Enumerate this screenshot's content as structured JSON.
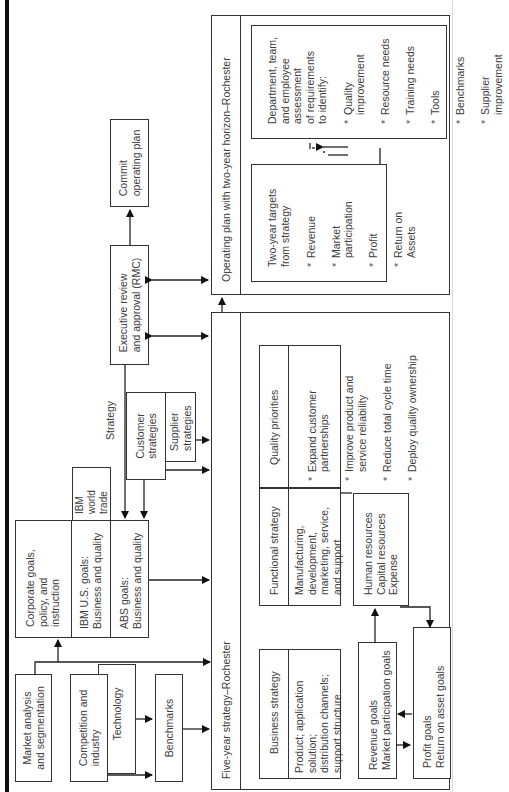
{
  "diagram": {
    "inputs": {
      "market_analysis": "Market analysis\nand segmentation",
      "competition": "Competition and\nindustry",
      "technology": "Technology",
      "benchmarks": "Benchmarks"
    },
    "goals": {
      "corporate": "Corporate goals,\npolicy, and\ninstruction",
      "ibm_us": "IBM U.S. goals:\nBusiness and quality",
      "abs": "ABS goals:\nBusiness and quality",
      "ibm_world_trade": "IBM\nworld\ntrade"
    },
    "strategy_label": "Strategy",
    "customer_strategies": "Customer\nstrategies",
    "supplier_strategies": "Supplier\nstrategies",
    "executive_review": "Executive review\nand approval (RMC)",
    "commit_plan": "Commit\noperating plan",
    "five_year": {
      "title": "Five-year strategy–Rochester",
      "business_strategy": {
        "title": "Business strategy",
        "body": "Product; application solution;\ndistribution channels;\nsupport structure"
      },
      "functional_strategy": {
        "title": "Functional strategy",
        "body": "Manufacturing,\ndevelopment,\nmarketing, service,\nand support"
      },
      "quality_priorities": {
        "title": "Quality priorities",
        "items": [
          "Expand customer\npartnerships",
          "Improve product and\nservice reliability",
          "Reduce total cycle time",
          "Deploy quality ownership"
        ]
      },
      "revenue_goals": "Revenue goals\nMarket participation goals",
      "resources": "Human resources\nCapital resources\nExpense",
      "profit_goals": "Profit goals\nReturn on asset goals"
    },
    "operating_plan": {
      "title": "Operating plan with two-year horizon–Rochester",
      "targets": {
        "title": "Two-year targets\nfrom strategy",
        "items": [
          "Revenue",
          "Market\nparticipation",
          "Profit",
          "Return on\nAssets"
        ]
      },
      "assessment": {
        "title": "Department, team,\nand employee\nassessment\nof requirements\nto identify:",
        "items": [
          "Quality improvement",
          "Resource needs",
          "Training needs",
          "Tools",
          "Benchmarks",
          "Supplier improvement"
        ]
      }
    }
  }
}
